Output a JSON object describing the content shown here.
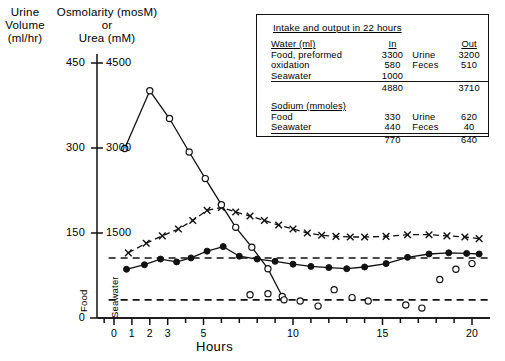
{
  "axes": {
    "left_outer_caption": "Urine\nVolume\n(ml/hr)",
    "left_inner_caption": "Osmolarity (mosM)\nor\nUrea (mM)",
    "xtitle": "Hours"
  },
  "annotations": {
    "food": "Food",
    "seawater": "Seawater"
  },
  "inset": {
    "title": "Intake and output in 22 hours",
    "water_header": "Water (ml)",
    "sodium_header": "Sodium (mmoles)",
    "col_in": "In",
    "col_out": "Out",
    "water_rows": [
      {
        "label": "Food, preformed",
        "in": "3300",
        "out_label": "Urine",
        "out": "3200"
      },
      {
        "label": "oxidation",
        "in": "580",
        "out_label": "Feces",
        "out": "510"
      },
      {
        "label": "Seawater",
        "in": "1000",
        "out_label": "",
        "out": ""
      }
    ],
    "water_totals": {
      "in": "4880",
      "out": "3710"
    },
    "sodium_rows": [
      {
        "label": "Food",
        "in": "330",
        "out_label": "Urine",
        "out": "620"
      },
      {
        "label": "Seawater",
        "in": "440",
        "out_label": "Feces",
        "out": "40"
      }
    ],
    "sodium_totals": {
      "in": "770",
      "out": "640"
    }
  },
  "chart_data": {
    "type": "line",
    "title": "",
    "xlabel": "Hours",
    "ylabel": "Osmolarity (mosM) or Urea (mM)",
    "ylabel_secondary": "Urine Volume (ml/hr)",
    "xlim": [
      -0.9,
      21.2
    ],
    "ylim": [
      0,
      4500
    ],
    "ylim_secondary": [
      0,
      450
    ],
    "yticks": [
      0,
      1500,
      3000,
      4500
    ],
    "yticks_secondary": [
      0,
      150,
      300,
      450
    ],
    "xticks_major": [
      0,
      1,
      2,
      3,
      5,
      10,
      15,
      20
    ],
    "xticks_all": [
      0,
      1,
      2,
      3,
      4,
      5,
      6,
      7,
      8,
      9,
      10,
      11,
      12,
      13,
      14,
      15,
      16,
      17,
      18,
      19,
      20
    ],
    "grid": false,
    "legend": "none",
    "reference_lines": [
      {
        "name": "upper-dashed-reference",
        "y": 1060,
        "style": "dashed"
      },
      {
        "name": "lower-dashed-reference",
        "y": 320,
        "style": "dashed"
      }
    ],
    "series": [
      {
        "name": "urine-osmolarity-open-circles",
        "marker": "open-circle",
        "line": "solid",
        "x": [
          0.6,
          2.0,
          3.1,
          4.2,
          5.1,
          6.0,
          6.8,
          7.7,
          8.6,
          9.4
        ],
        "values": [
          2990,
          4010,
          3520,
          2930,
          2460,
          2000,
          1600,
          1250,
          870,
          380
        ]
      },
      {
        "name": "urine-volume-open-circles-scattered",
        "marker": "open-circle",
        "line": "none",
        "x": [
          7.6,
          8.6,
          9.5,
          10.4,
          11.4,
          12.3,
          13.3,
          14.2,
          16.3,
          17.2,
          18.2,
          19.1,
          20.0
        ],
        "values": [
          410,
          430,
          320,
          300,
          210,
          500,
          360,
          300,
          230,
          175,
          680,
          860,
          960
        ]
      },
      {
        "name": "urea-x-markers",
        "marker": "x",
        "line": "dashed",
        "x": [
          0.8,
          1.8,
          2.7,
          3.6,
          4.4,
          5.2,
          6.0,
          6.8,
          7.6,
          8.4,
          9.2,
          10.0,
          10.8,
          11.6,
          12.4,
          13.2,
          14.0,
          15.2,
          16.4,
          17.6,
          18.6,
          19.6,
          20.4
        ],
        "values": [
          1150,
          1320,
          1450,
          1570,
          1720,
          1900,
          1950,
          1870,
          1800,
          1720,
          1640,
          1570,
          1500,
          1460,
          1440,
          1430,
          1430,
          1440,
          1470,
          1470,
          1450,
          1430,
          1400
        ]
      },
      {
        "name": "osmolarity-filled-circles",
        "marker": "filled-circle",
        "line": "solid",
        "x": [
          0.7,
          1.7,
          2.6,
          3.5,
          4.3,
          5.2,
          6.1,
          7.0,
          8.0,
          9.0,
          10.0,
          11.0,
          12.0,
          13.0,
          14.0,
          15.2,
          16.4,
          17.6,
          18.7,
          19.7,
          20.4
        ],
        "values": [
          860,
          940,
          1040,
          990,
          1060,
          1180,
          1260,
          1090,
          1040,
          1000,
          950,
          910,
          890,
          870,
          900,
          960,
          1070,
          1130,
          1150,
          1140,
          1130
        ]
      }
    ]
  }
}
